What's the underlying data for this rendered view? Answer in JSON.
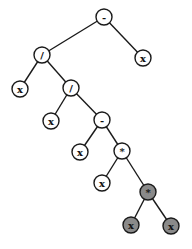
{
  "diagram": {
    "type": "expression-tree",
    "colors": {
      "normal_fill": "#ffffff",
      "highlight_fill": "#8a8a8a",
      "stroke": "#1a1a1a"
    },
    "nodes": [
      {
        "id": "n0",
        "label": "-",
        "x": 104,
        "y": 17,
        "highlight": false
      },
      {
        "id": "n1",
        "label": "/",
        "x": 42,
        "y": 55,
        "highlight": false
      },
      {
        "id": "n2",
        "label": "x",
        "x": 143,
        "y": 58,
        "highlight": false
      },
      {
        "id": "n3",
        "label": "x",
        "x": 20,
        "y": 89,
        "highlight": false
      },
      {
        "id": "n4",
        "label": "/",
        "x": 71,
        "y": 88,
        "highlight": false
      },
      {
        "id": "n5",
        "label": "x",
        "x": 51,
        "y": 121,
        "highlight": false
      },
      {
        "id": "n6",
        "label": "-",
        "x": 102,
        "y": 120,
        "highlight": false
      },
      {
        "id": "n7",
        "label": "x",
        "x": 80,
        "y": 152,
        "highlight": false
      },
      {
        "id": "n8",
        "label": "*",
        "x": 122,
        "y": 151,
        "highlight": false
      },
      {
        "id": "n9",
        "label": "x",
        "x": 102,
        "y": 183,
        "highlight": false
      },
      {
        "id": "n10",
        "label": "*",
        "x": 148,
        "y": 192,
        "highlight": true
      },
      {
        "id": "n11",
        "label": "x",
        "x": 131,
        "y": 225,
        "highlight": true
      },
      {
        "id": "n12",
        "label": "x",
        "x": 171,
        "y": 226,
        "highlight": true
      }
    ],
    "edges": [
      [
        "n0",
        "n1"
      ],
      [
        "n0",
        "n2"
      ],
      [
        "n1",
        "n3"
      ],
      [
        "n1",
        "n4"
      ],
      [
        "n4",
        "n5"
      ],
      [
        "n4",
        "n6"
      ],
      [
        "n6",
        "n7"
      ],
      [
        "n6",
        "n8"
      ],
      [
        "n8",
        "n9"
      ],
      [
        "n8",
        "n10"
      ],
      [
        "n10",
        "n11"
      ],
      [
        "n10",
        "n12"
      ]
    ]
  }
}
